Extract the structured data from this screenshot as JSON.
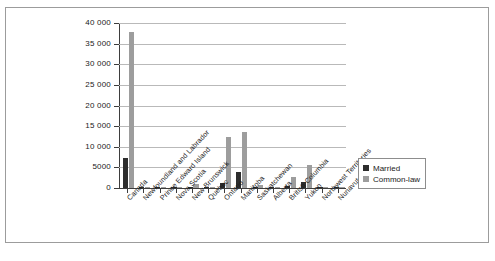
{
  "chart_data": {
    "type": "bar",
    "title": "",
    "xlabel": "",
    "ylabel": "",
    "ylim": [
      0,
      40000
    ],
    "grid": true,
    "legend_position": "right",
    "categories": [
      "Canada",
      "Newfoundland and Labrador",
      "Prince Edward Island",
      "Nova Scotia",
      "New Brunswick",
      "Quebec",
      "Ontario",
      "Manitoba",
      "Saskatchewan",
      "Alberta",
      "British Columbia",
      "Yukon",
      "Northwest Territories",
      "Nunavut"
    ],
    "y_ticks": [
      "0",
      "5000",
      "10 000",
      "15 000",
      "20 000",
      "25 000",
      "30 000",
      "35 000",
      "40 000"
    ],
    "y_tick_values": [
      0,
      5000,
      10000,
      15000,
      20000,
      25000,
      30000,
      35000,
      40000
    ],
    "series": [
      {
        "name": "Married",
        "color": "#2d2d2d",
        "values": [
          7225,
          40,
          10,
          90,
          60,
          330,
          1220,
          3810,
          110,
          50,
          390,
          1410,
          25,
          20
        ]
      },
      {
        "name": "Common-law",
        "color": "#9d9d9d",
        "values": [
          37830,
          110,
          25,
          210,
          920,
          255,
          12330,
          13690,
          640,
          105,
          2640,
          5680,
          40,
          30
        ]
      }
    ]
  },
  "legend": {
    "entries": [
      {
        "label": "Married",
        "color": "#2d2d2d"
      },
      {
        "label": "Common-law",
        "color": "#9d9d9d"
      }
    ]
  },
  "page_artifact": {
    "text": ""
  }
}
